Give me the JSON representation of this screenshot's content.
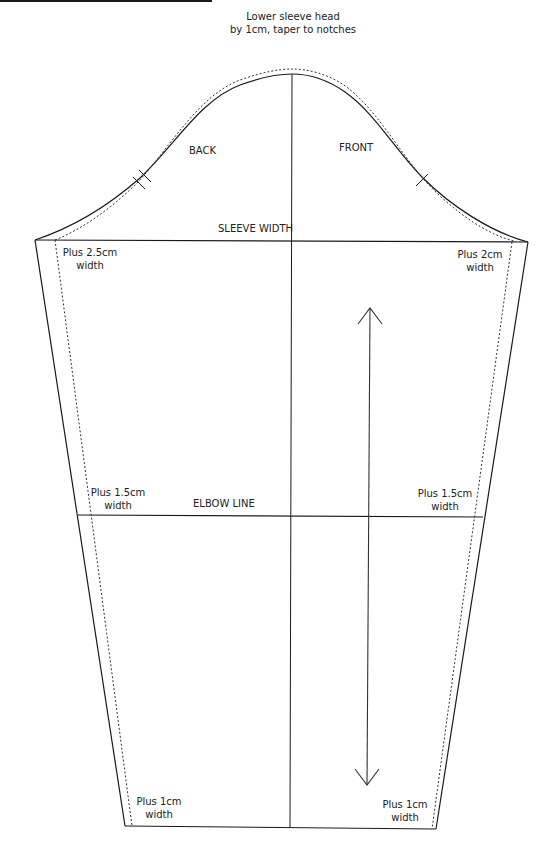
{
  "diagram": {
    "title_rule": true,
    "colors": {
      "line": "#1a1a1a",
      "dotted": "#333333",
      "background": "#ffffff"
    },
    "annotations": {
      "head_note": {
        "line1": "Lower sleeve head",
        "line2": "by 1cm, taper to notches"
      },
      "back": "BACK",
      "front": "FRONT",
      "sleeve_width": "SLEEVE WIDTH",
      "elbow_line": "ELBOW LINE",
      "upper_left": {
        "line1": "Plus 2.5cm",
        "line2": "width"
      },
      "upper_right": {
        "line1": "Plus 2cm",
        "line2": "width"
      },
      "elbow_left": {
        "line1": "Plus 1.5cm",
        "line2": "width"
      },
      "elbow_right": {
        "line1": "Plus 1.5cm",
        "line2": "width"
      },
      "hem_left": {
        "line1": "Plus 1cm",
        "line2": "width"
      },
      "hem_right": {
        "line1": "Plus 1cm",
        "line2": "width"
      }
    },
    "elements": [
      "sleeve-head-curve",
      "lowered-sleeve-head-dotted",
      "center-grain-line",
      "sleeve-width-line",
      "elbow-line",
      "hem-line",
      "left-seam",
      "right-seam",
      "left-widened-seam-dotted",
      "right-widened-seam-dotted",
      "back-double-notch",
      "front-single-notch",
      "grainline-arrow"
    ]
  }
}
